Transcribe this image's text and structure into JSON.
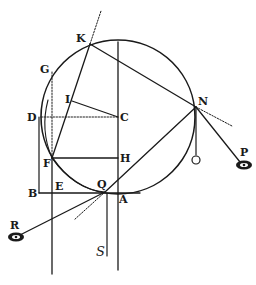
{
  "figure": {
    "colors": {
      "ink": "#1a1a1a",
      "background": "#ffffff"
    },
    "labels": {
      "K": "K",
      "G": "G",
      "I": "I",
      "D": "D",
      "C": "C",
      "N": "N",
      "F": "F",
      "H": "H",
      "O": "O",
      "P": "P",
      "B": "B",
      "E": "E",
      "Q": "Q",
      "A": "A",
      "R": "R",
      "S": "S"
    },
    "icons": [
      "eye-icon-R",
      "eye-icon-P"
    ]
  }
}
